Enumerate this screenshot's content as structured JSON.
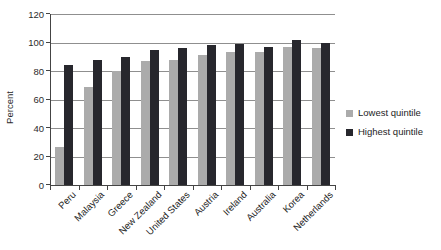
{
  "chart_data": {
    "type": "bar",
    "title": "",
    "xlabel": "",
    "ylabel": "Percent",
    "ylim": [
      0,
      120
    ],
    "yticks": [
      0,
      20,
      40,
      60,
      80,
      100,
      120
    ],
    "grid": true,
    "legend_position": "right",
    "categories": [
      "Peru",
      "Malaysia",
      "Greece",
      "New Zealand",
      "United States",
      "Austria",
      "Ireland",
      "Australia",
      "Korea",
      "Netherlands"
    ],
    "series": [
      {
        "name": "Lowest quintile",
        "color": "#ababab",
        "values": [
          27,
          69,
          80,
          87,
          88,
          91,
          93,
          93,
          97,
          96
        ]
      },
      {
        "name": "Highest quintile",
        "color": "#27272d",
        "values": [
          84,
          88,
          90,
          95,
          96,
          98,
          99,
          97,
          102,
          100
        ]
      }
    ],
    "colors": {
      "gridline": "#8f8f8f",
      "axis": "#444444",
      "text": "#1d1d1d",
      "background": "#ffffff"
    }
  }
}
